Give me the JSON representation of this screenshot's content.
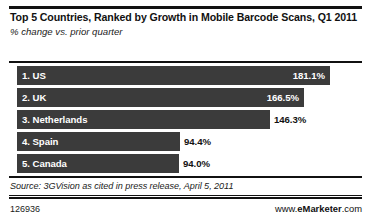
{
  "header": {
    "title": "Top 5 Countries, Ranked by Growth in Mobile Barcode Scans, Q1 2011",
    "subtitle": "% change vs. prior quarter"
  },
  "source": {
    "note": "Source: 3GVision as cited in press release, April 5, 2011"
  },
  "footer": {
    "chart_id": "126936",
    "brand_prefix": "www.",
    "brand_name": "eMarketer",
    "brand_suffix": ".com"
  },
  "colors": {
    "bar": "#3b3b3b",
    "rule": "#111111",
    "value_inside": "#ffffff",
    "value_outside": "#111111",
    "background": "#ffffff"
  },
  "chart_data": {
    "type": "bar",
    "orientation": "horizontal",
    "title": "Top 5 Countries, Ranked by Growth in Mobile Barcode Scans, Q1 2011",
    "subtitle": "% change vs. prior quarter",
    "xlabel": "",
    "ylabel": "",
    "xlim": [
      0,
      190
    ],
    "grid": false,
    "legend": false,
    "categories": [
      "1. US",
      "2. UK",
      "3. Netherlands",
      "4. Spain",
      "5. Canada"
    ],
    "values": [
      181.1,
      166.5,
      146.3,
      94.4,
      94.0
    ],
    "value_labels": [
      "181.1%",
      "166.5%",
      "146.3%",
      "94.4%",
      "94.0%"
    ],
    "bars": [
      {
        "rank": 1,
        "label": "1. US",
        "value": 181.1,
        "value_label": "181.1%",
        "label_position": "inside"
      },
      {
        "rank": 2,
        "label": "2. UK",
        "value": 166.5,
        "value_label": "166.5%",
        "label_position": "inside"
      },
      {
        "rank": 3,
        "label": "3. Netherlands",
        "value": 146.3,
        "value_label": "146.3%",
        "label_position": "outside"
      },
      {
        "rank": 4,
        "label": "4. Spain",
        "value": 94.4,
        "value_label": "94.4%",
        "label_position": "outside"
      },
      {
        "rank": 5,
        "label": "5. Canada",
        "value": 94.0,
        "value_label": "94.0%",
        "label_position": "outside"
      }
    ],
    "source": "Source: 3GVision as cited in press release, April 5, 2011"
  }
}
